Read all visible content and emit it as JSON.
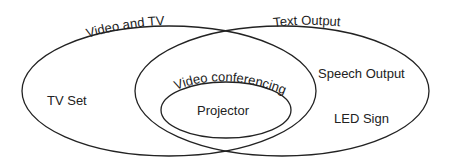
{
  "diagram": {
    "type": "venn",
    "sets": [
      {
        "id": "video-and-tv",
        "label": "Video and TV",
        "members": [
          "TV Set"
        ]
      },
      {
        "id": "text-output",
        "label": "Text Output",
        "members": [
          "Speech Output",
          "LED Sign"
        ]
      },
      {
        "id": "video-conferencing",
        "label": "Video conferencing",
        "members": [
          "Projector"
        ]
      }
    ],
    "labels": {
      "video_and_tv": "Video and TV",
      "text_output": "Text Output",
      "video_conferencing": "Video conferencing",
      "tv_set": "TV Set",
      "speech_output": "Speech Output",
      "led_sign": "LED Sign",
      "projector": "Projector"
    },
    "colors": {
      "stroke": "#222222",
      "background": "#ffffff"
    }
  }
}
